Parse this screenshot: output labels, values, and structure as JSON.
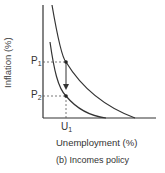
{
  "diagram": {
    "caption": "(b) Incomes policy",
    "x_axis_label": "Unemployment (%)",
    "y_axis_label": "Inflation (%)",
    "points": {
      "p1": {
        "main": "P",
        "sub": "1"
      },
      "p2": {
        "main": "P",
        "sub": "2"
      },
      "u1": {
        "main": "U",
        "sub": "1"
      }
    },
    "curves": [
      "upper Phillips curve",
      "lower Phillips curve"
    ],
    "arrow": "shift downward from P1 to P2 at U1",
    "colors": {
      "line": "#333333",
      "dashed": "#555555"
    }
  }
}
